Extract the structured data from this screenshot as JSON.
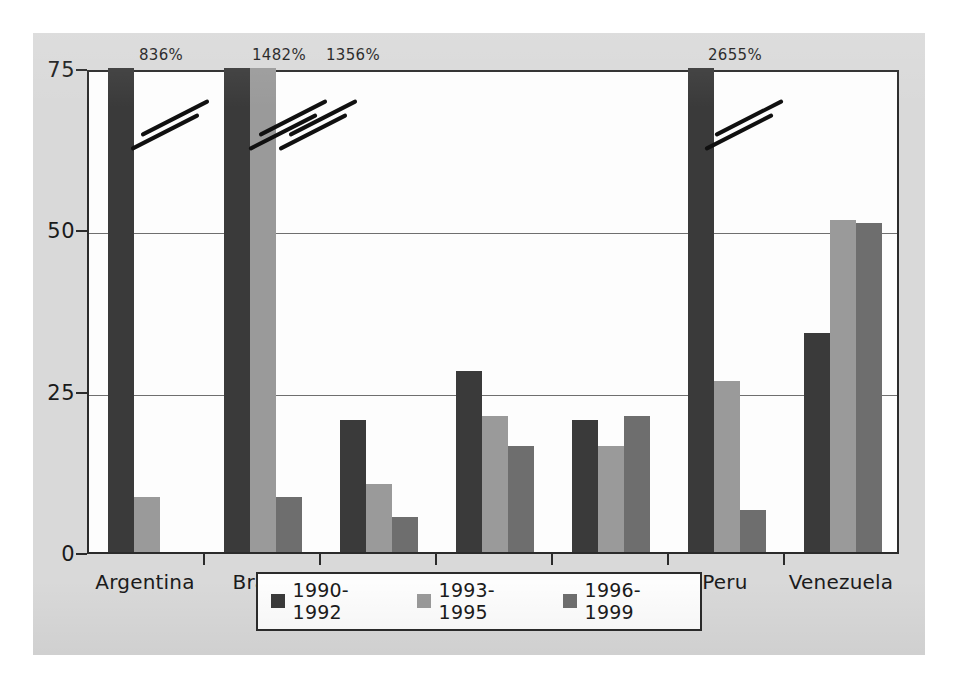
{
  "chart_data": {
    "type": "bar",
    "title": "",
    "xlabel": "",
    "ylabel": "",
    "ylim": [
      0,
      75
    ],
    "yticks": [
      0,
      25,
      50,
      75
    ],
    "ytick_labels": [
      "0",
      "25",
      "50",
      "75"
    ],
    "grid": true,
    "legend_position": "bottom-center",
    "categories": [
      "Argentina",
      "Brazil",
      "Chile",
      "Colombia",
      "Mexico",
      "Peru",
      "Venezuela"
    ],
    "series": [
      {
        "name": "1990-1992",
        "color": "#3a3a3a",
        "values": [
          836,
          1482,
          20.5,
          28,
          20.5,
          2655,
          34
        ]
      },
      {
        "name": "1993-1995",
        "color": "#9a9a9a",
        "values": [
          8.5,
          1356,
          10.5,
          21,
          16.5,
          26.5,
          51.5
        ]
      },
      {
        "name": "1996-1999",
        "color": "#6e6e6e",
        "values": [
          null,
          8.5,
          5.5,
          16.5,
          21,
          6.5,
          51
        ]
      }
    ],
    "annotations": [
      {
        "text": "836%",
        "category": "Argentina",
        "series": "1990-1992",
        "x_px": 128,
        "off_scale": true
      },
      {
        "text": "1482%",
        "category": "Brazil",
        "series": "1990-1992",
        "x_px": 246,
        "off_scale": true
      },
      {
        "text": "1356%",
        "category": "Brazil",
        "series": "1993-1995",
        "x_px": 320,
        "off_scale": true
      },
      {
        "text": "2655%",
        "category": "Peru",
        "series": "1990-1992",
        "x_px": 702,
        "off_scale": true
      }
    ],
    "axis_breaks": [
      {
        "category": "Argentina",
        "series": "1990-1992",
        "x_px": 128,
        "strokes": 2
      },
      {
        "category": "Brazil",
        "series": "1990-1992",
        "x_px": 246,
        "strokes": 2
      },
      {
        "category": "Brazil",
        "series": "1993-1995",
        "x_px": 276,
        "strokes": 2
      },
      {
        "category": "Peru",
        "series": "1990-1992",
        "x_px": 702,
        "strokes": 2
      }
    ]
  },
  "legend": {
    "items": [
      {
        "label": "1990-1992",
        "swatch": "s0"
      },
      {
        "label": "1993-1995",
        "swatch": "s1"
      },
      {
        "label": "1996-1999",
        "swatch": "s2"
      }
    ]
  },
  "colors": {
    "series_1990_1992": "#3a3a3a",
    "series_1993_1995": "#9a9a9a",
    "series_1996_1999": "#6e6e6e",
    "panel_background": "#d9d9d9",
    "plot_background": "#fdfdfd",
    "axis": "#2b2b2b",
    "gridline": "#6f6f6f"
  }
}
